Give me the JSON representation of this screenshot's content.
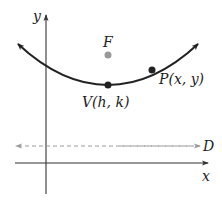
{
  "diagram": {
    "type": "parabola-focus-directrix",
    "axes": {
      "x_label": "x",
      "y_label": "y"
    },
    "points": {
      "focus": {
        "label": "F",
        "color": "#999999"
      },
      "vertex": {
        "label": "V(h, k)",
        "color": "#222222"
      },
      "point": {
        "label": "P(x, y)",
        "color": "#222222"
      }
    },
    "directrix": {
      "label": "D",
      "color": "#9a9a9a",
      "style": "dashed"
    },
    "curve_color": "#222222",
    "axis_color": "#333333"
  }
}
